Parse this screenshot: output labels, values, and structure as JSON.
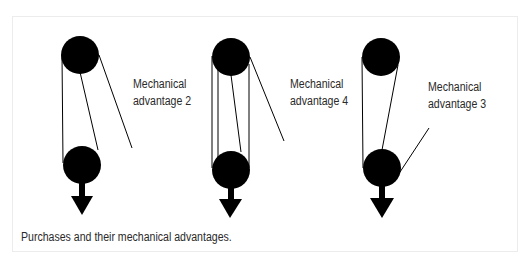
{
  "figure": {
    "caption": "Purchases and their mechanical advantages.",
    "systems": [
      {
        "id": "ma2",
        "label_line1": "Mechanical",
        "label_line2": "advantage 2",
        "mechanical_advantage": 2
      },
      {
        "id": "ma4",
        "label_line1": "Mechanical",
        "label_line2": "advantage 4",
        "mechanical_advantage": 4
      },
      {
        "id": "ma3",
        "label_line1": "Mechanical",
        "label_line2": "advantage 3",
        "mechanical_advantage": 3
      }
    ],
    "colors": {
      "pulley": "#000000",
      "rope": "#000000",
      "text": "#2a2a2a",
      "frame_border": "#ececec"
    }
  }
}
